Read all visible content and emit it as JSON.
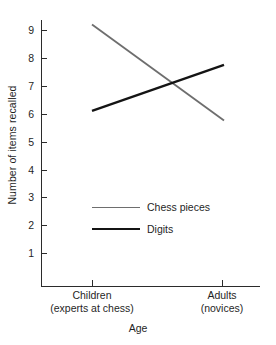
{
  "chart_data": {
    "type": "line",
    "title": "",
    "xlabel": "Age",
    "ylabel": "Number of items recalled",
    "categories": [
      "Children\n(experts at chess)",
      "Adults\n(novices)"
    ],
    "category_labels": [
      {
        "main": "Children",
        "sub": "(experts at chess)"
      },
      {
        "main": "Adults",
        "sub": "(novices)"
      }
    ],
    "ylim": [
      0,
      9.6
    ],
    "yticks": [
      9,
      8,
      7,
      6,
      5,
      4,
      3,
      2,
      1
    ],
    "grid": false,
    "legend_position": "center",
    "series": [
      {
        "name": "Chess pieces",
        "color": "#6e6e6e",
        "values": [
          9.2,
          5.75
        ]
      },
      {
        "name": "Digits",
        "color": "#141414",
        "values": [
          6.1,
          7.75
        ]
      }
    ]
  }
}
